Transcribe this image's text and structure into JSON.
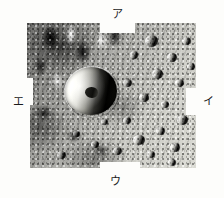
{
  "figure": {
    "name": "cratered-surface-photograph",
    "colors": {
      "background": "#fdfdfb",
      "label_text": "#1b1b1b",
      "terrain_light": "#c9c9c3",
      "terrain_mid": "#9a9a98",
      "terrain_dark": "#3a3a37",
      "crater_shadow": "#141413",
      "crater_highlight": "#f2f2ee"
    },
    "callouts": [
      {
        "id": "a",
        "label": "ア",
        "position": "top"
      },
      {
        "id": "i",
        "label": "イ",
        "position": "right"
      },
      {
        "id": "u",
        "label": "ウ",
        "position": "bottom"
      },
      {
        "id": "e",
        "label": "エ",
        "position": "left"
      }
    ],
    "features": {
      "main_crater": "large central crater, bright western rim, shadowed eastern floor, central peak",
      "upper_left": "high-contrast ridges with deep shadows",
      "right_side": "lighter terrain densely pocked with small craters",
      "lower_left": "mottled mid-gray plains"
    }
  }
}
